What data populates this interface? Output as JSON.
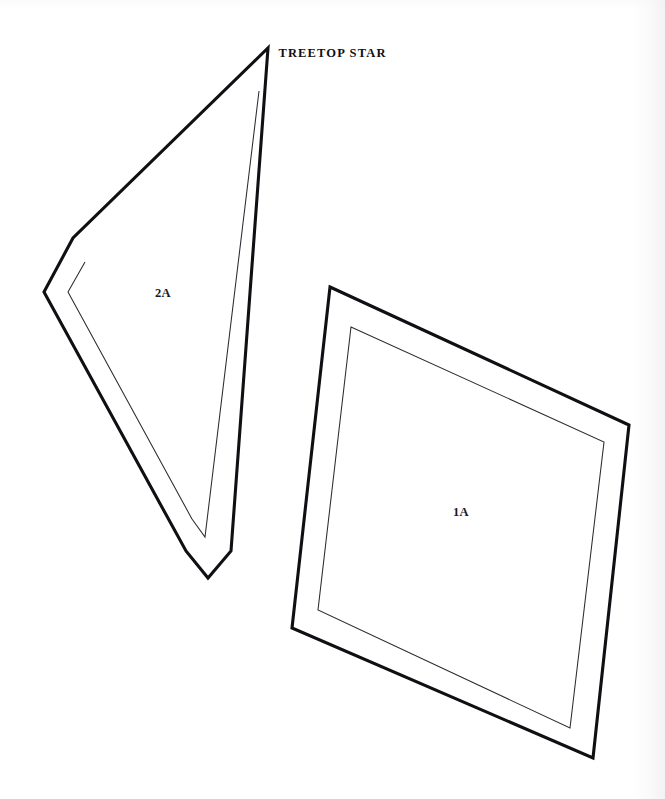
{
  "sheet": {
    "title": "TREETOP STAR",
    "title_top": 46,
    "title_center_x": 426,
    "background_color": "#ffffff",
    "ink_color": "#101014",
    "seam_color": "#2b2b31",
    "width": 665,
    "height": 799
  },
  "pieces": [
    {
      "id": "piece-2a",
      "label": "2A",
      "label_x": 163,
      "label_y": 297,
      "shape": "quadrilateral-triangle-wedge",
      "outline_points": "268,48 231,551 208,578 186,551 44,292 73,238",
      "seam_points": "259,91 205,537 192,519 68,292 85,262",
      "outline_color": "#101014",
      "seam_color": "#2b2b31",
      "fill_color": "#ffffff"
    },
    {
      "id": "piece-1a",
      "label": "1A",
      "label_x": 461,
      "label_y": 516,
      "shape": "quadrilateral-diamond",
      "outline_points": "330,287 629,425 593,758 292,628",
      "seam_points": "351,327 604,442 570,728 318,610",
      "outline_color": "#101014",
      "seam_color": "#2b2b31",
      "fill_color": "#ffffff"
    }
  ]
}
